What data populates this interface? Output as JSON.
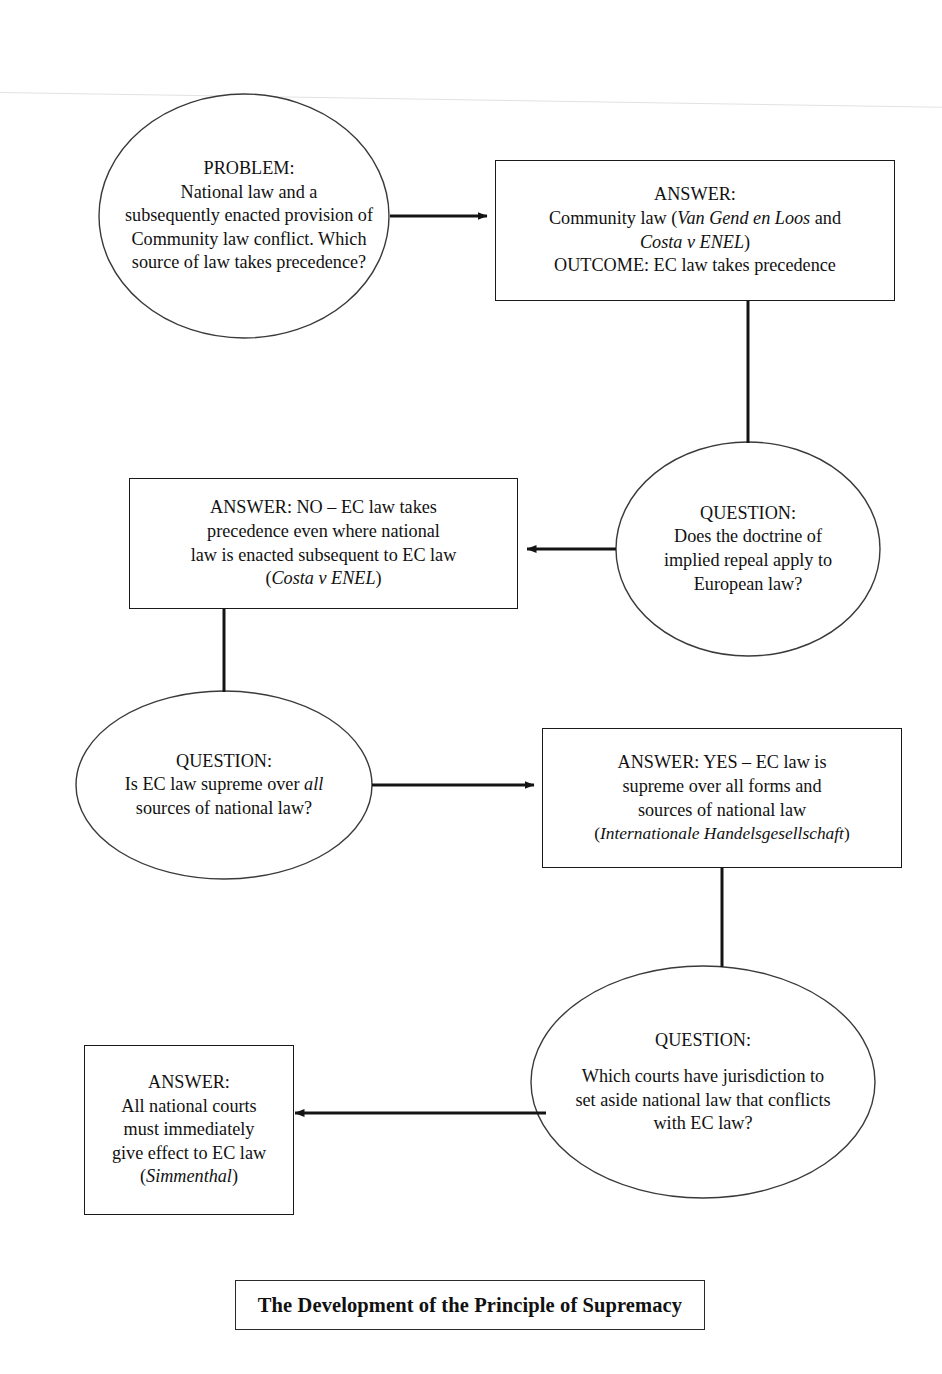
{
  "document": {
    "type": "flowchart",
    "title": "The Development of the Principle of Supremacy",
    "orientation": "zig-zag top-to-bottom",
    "page_width": 942,
    "page_height": 1374,
    "stroke_color": "#1a1a1a",
    "background_color": "#ffffff"
  },
  "nodes": [
    {
      "id": "problem",
      "shape": "ellipse",
      "role": "problem",
      "label_lines": [
        "PROBLEM:",
        "National law and a",
        "subsequently enacted provision of",
        "Community law conflict. Which",
        "source of law takes precedence?"
      ],
      "plain_text": "PROBLEM: National law and a subsequently enacted provision of Community law conflict. Which source of law takes precedence?"
    },
    {
      "id": "answer-1",
      "shape": "rectangle",
      "role": "answer",
      "label_lines": [
        "ANSWER:",
        "Community law (Van Gend en Loos and",
        "Costa v ENEL)",
        "OUTCOME: EC law takes precedence"
      ],
      "italic_terms": [
        "Van Gend en Loos",
        "Costa v ENEL"
      ],
      "plain_text": "ANSWER: Community law (Van Gend en Loos and Costa v ENEL) OUTCOME: EC law takes precedence"
    },
    {
      "id": "answer-2",
      "shape": "rectangle",
      "role": "answer",
      "label_lines": [
        "ANSWER: NO – EC law takes",
        "precedence even where national",
        "law is enacted subsequent to EC law",
        "(Costa v ENEL)"
      ],
      "italic_terms": [
        "Costa v ENEL"
      ],
      "plain_text": "ANSWER: NO – EC law takes precedence even where national law is enacted subsequent to EC law (Costa v ENEL)"
    },
    {
      "id": "question-1",
      "shape": "ellipse",
      "role": "question",
      "label_lines": [
        "QUESTION:",
        "Does the doctrine of",
        "implied repeal apply to",
        "European law?"
      ],
      "plain_text": "QUESTION: Does the doctrine of implied repeal apply to European law?"
    },
    {
      "id": "question-2",
      "shape": "ellipse",
      "role": "question",
      "label_lines": [
        "QUESTION:",
        "Is EC law supreme over all",
        "sources of national law?"
      ],
      "italic_terms": [
        "all"
      ],
      "plain_text": "QUESTION: Is EC law supreme over all sources of national law?"
    },
    {
      "id": "answer-3",
      "shape": "rectangle",
      "role": "answer",
      "label_lines": [
        "ANSWER: YES – EC law is",
        "supreme over all forms and",
        "sources of national law",
        "(Internationale Handelsgesellschaft)"
      ],
      "italic_terms": [
        "Internationale Handelsgesellschaft"
      ],
      "plain_text": "ANSWER: YES – EC law is supreme over all forms and sources of national law (Internationale Handelsgesellschaft)"
    },
    {
      "id": "question-3",
      "shape": "ellipse",
      "role": "question",
      "label_lines": [
        "QUESTION:",
        "Which courts have jurisdiction to",
        "set aside national law that conflicts",
        "with EC law?"
      ],
      "plain_text": "QUESTION: Which courts have jurisdiction to set aside national law that conflicts with EC law?"
    },
    {
      "id": "answer-4",
      "shape": "rectangle",
      "role": "answer",
      "label_lines": [
        "ANSWER:",
        "All national courts",
        "must immediately",
        "give effect to EC law",
        "(Simmenthal)"
      ],
      "italic_terms": [
        "Simmenthal"
      ],
      "plain_text": "ANSWER: All national courts must immediately give effect to EC law (Simmenthal)"
    }
  ],
  "edges": [
    {
      "from": "problem",
      "to": "answer-1",
      "style": "arrow",
      "direction": "right"
    },
    {
      "from": "answer-1",
      "to": "question-1",
      "style": "plain",
      "direction": "down"
    },
    {
      "from": "question-1",
      "to": "answer-2",
      "style": "arrow",
      "direction": "left"
    },
    {
      "from": "answer-2",
      "to": "question-2",
      "style": "plain",
      "direction": "down"
    },
    {
      "from": "question-2",
      "to": "answer-3",
      "style": "arrow",
      "direction": "right"
    },
    {
      "from": "answer-3",
      "to": "question-3",
      "style": "plain",
      "direction": "down"
    },
    {
      "from": "question-3",
      "to": "answer-4",
      "style": "arrow",
      "direction": "left"
    }
  ],
  "footer": {
    "caption": "The Development of the Principle of Supremacy"
  }
}
